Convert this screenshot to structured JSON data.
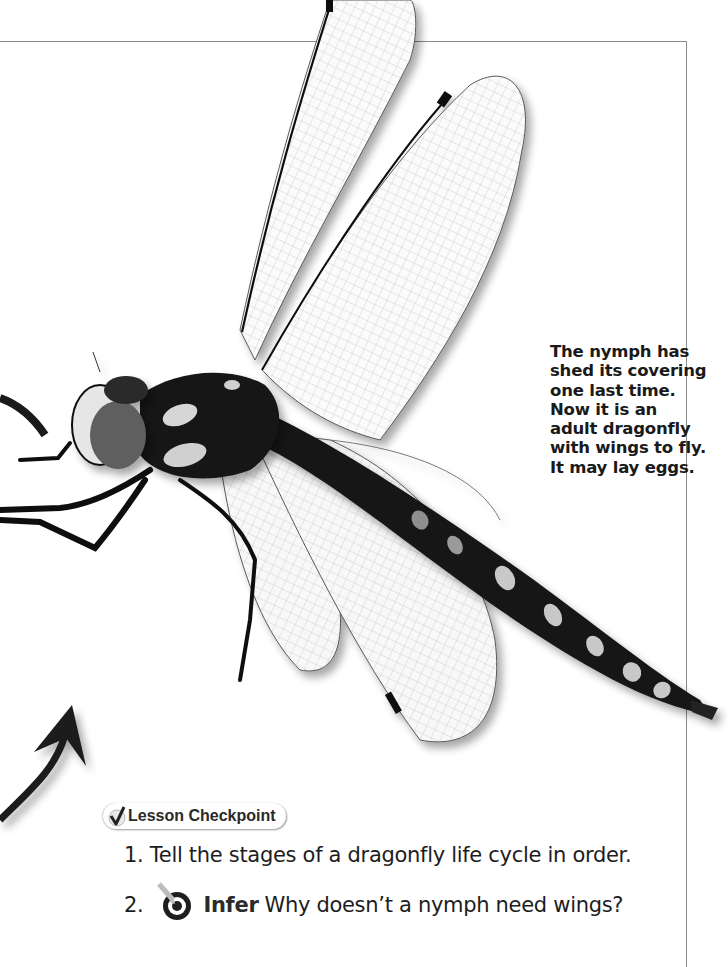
{
  "page": {
    "caption_lines": [
      "The nymph has",
      "shed its covering",
      "one last time.",
      "Now it is an",
      "adult dragonfly",
      "with wings to fly.",
      "It may lay eggs."
    ],
    "illustration": {
      "subject": "adult dragonfly photograph",
      "arrow_icon": "curved-arrow-up-icon"
    }
  },
  "checkpoint": {
    "title": "Lesson Checkpoint",
    "icon": "checkmark-icon",
    "questions": [
      {
        "number": "1.",
        "text": "Tell the stages of a dragonfly life cycle in order."
      },
      {
        "number": "2.",
        "icon": "target-arrow-icon",
        "keyword": "Infer",
        "text": "Why doesn’t a nymph need wings?"
      }
    ]
  },
  "colors": {
    "text": "#1d1d1d",
    "frame": "#8a8a8a",
    "background": "#ffffff"
  }
}
